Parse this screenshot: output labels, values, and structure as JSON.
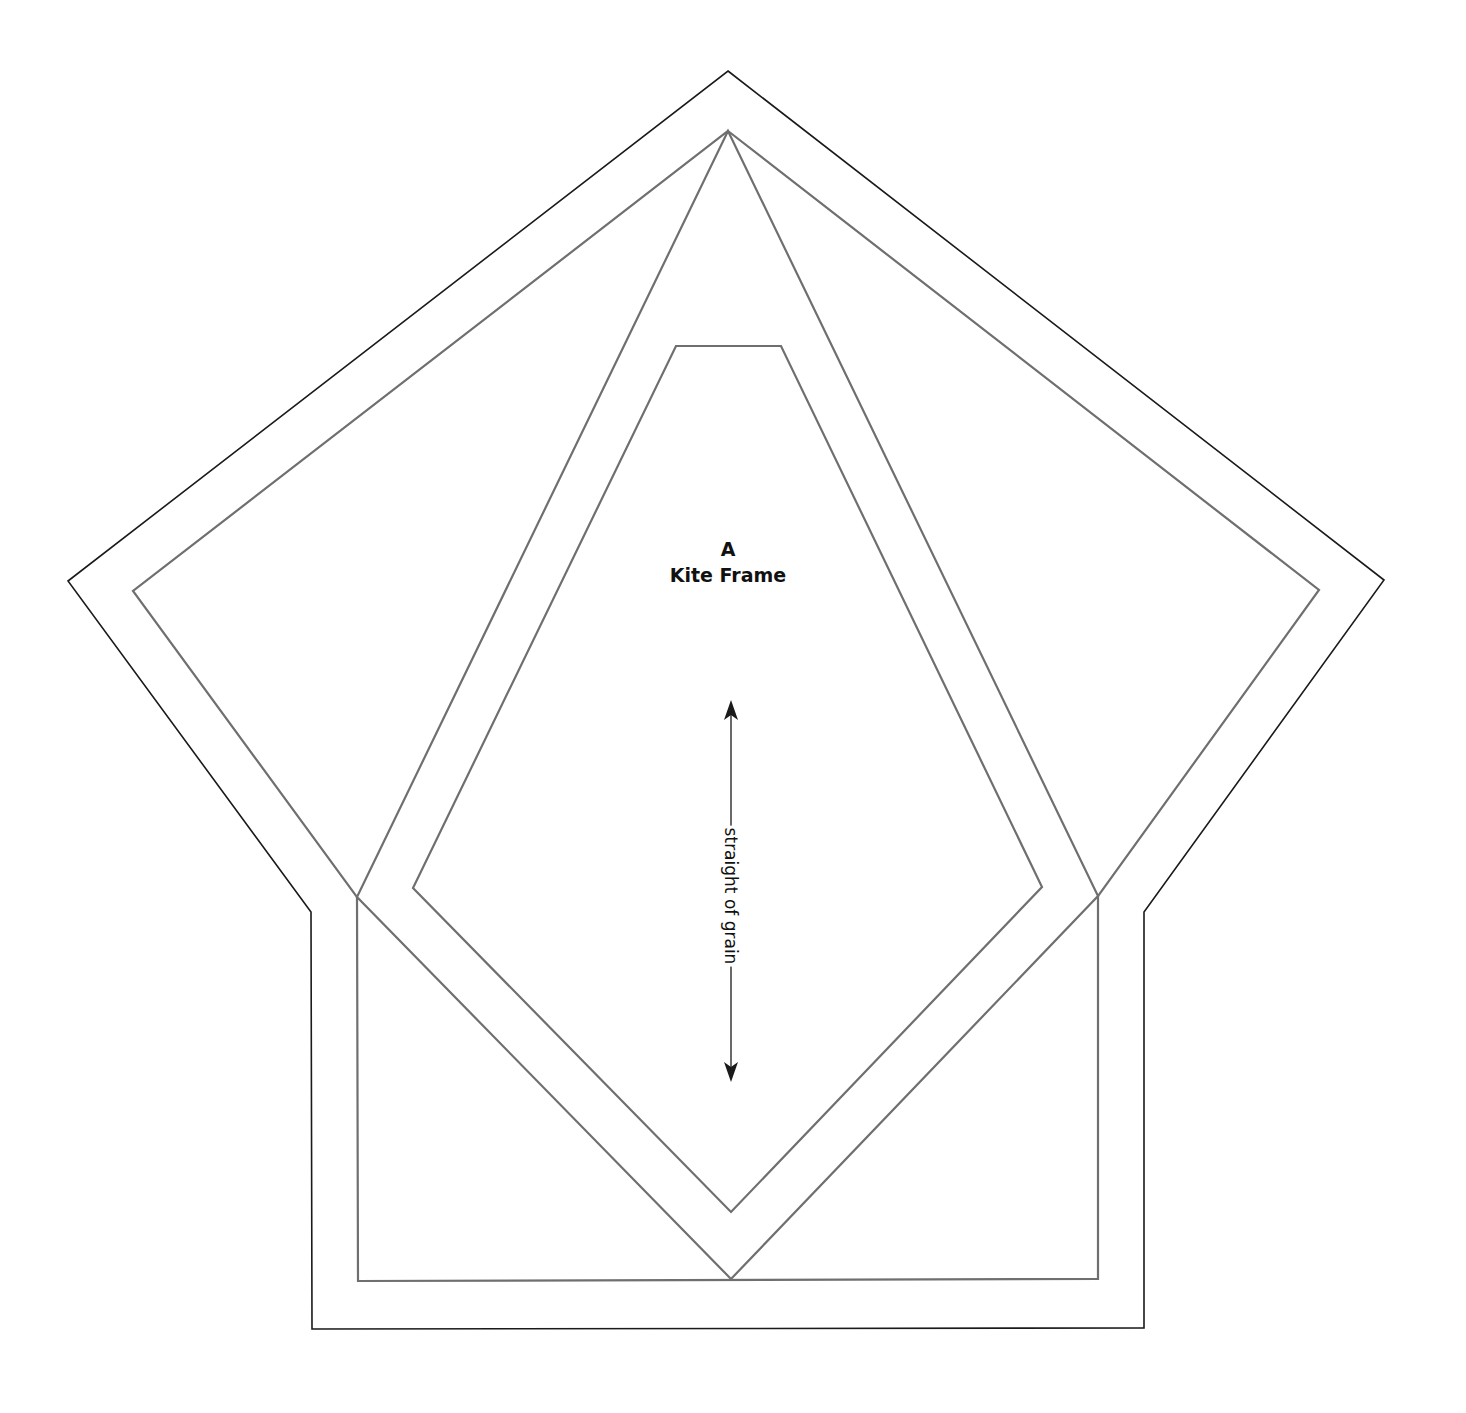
{
  "pattern": {
    "piece_letter": "A",
    "piece_name": "Kite Frame",
    "grainline_label": "straight of grain"
  },
  "colors": {
    "background": "#ffffff",
    "cutting_line": "#1a1a1a",
    "sewing_line": "#6f6f6f",
    "text": "#111111"
  },
  "shapes": {
    "outer_cutting_outline": "728,71 1384,580 1144,912 1144,1328 312,1329 311,912 68,581",
    "inner_sewing_outline": "728,131 1319,590 1098,896 1098,1279 358,1281 357,897 133,591",
    "large_kite": "728,131 1098,896 731,1279 357,897",
    "inner_kite": "676,346 781,346 1042,887 731,1212 413,888"
  },
  "grainline": {
    "x": 731,
    "top_y": 700,
    "bottom_y": 1082
  }
}
